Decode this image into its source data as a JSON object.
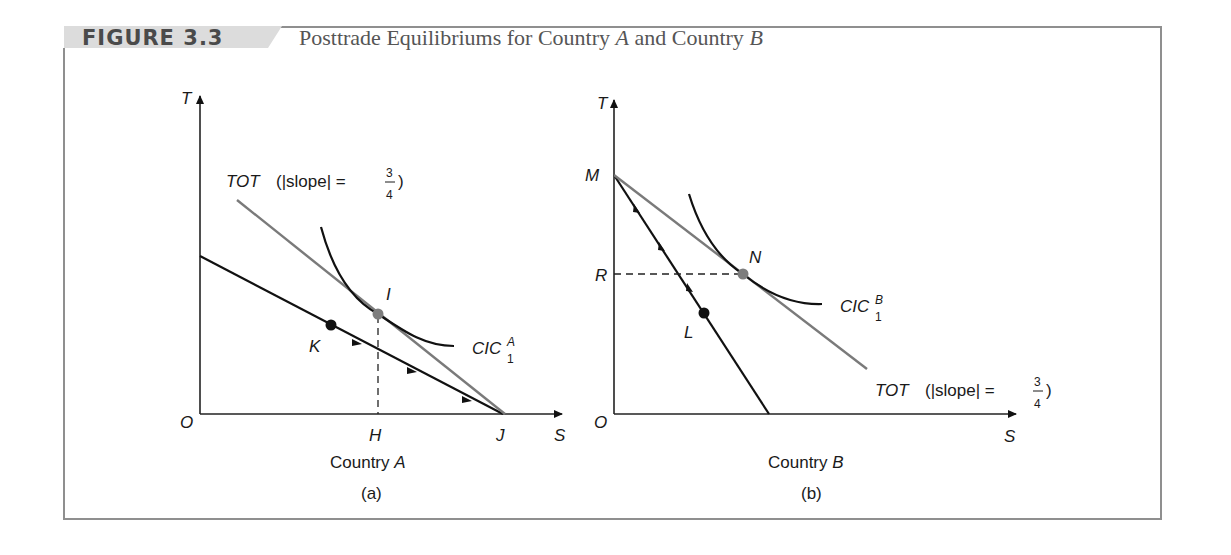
{
  "figure": {
    "number": "FIGURE 3.3",
    "title_prefix": "Posttrade Equilibriums for Country ",
    "title_country_a": "A",
    "title_mid": " and Country ",
    "title_country_b": "B"
  },
  "panel_a": {
    "y_axis_label": "T",
    "x_axis_label": "S",
    "origin_label": "O",
    "country_label_prefix": "Country ",
    "country_label_letter": "A",
    "caption": "(a)",
    "tot_label": "TOT",
    "tot_slope_text": "(|slope| = ",
    "tot_slope_num": "3",
    "tot_slope_den": "4",
    "tot_close": ")",
    "cic_label": "CIC",
    "cic_sup": "A",
    "cic_sub": "1",
    "points": {
      "I": "I",
      "K": "K",
      "H": "H",
      "J": "J"
    }
  },
  "panel_b": {
    "y_axis_label": "T",
    "x_axis_label": "S",
    "origin_label": "O",
    "country_label_prefix": "Country ",
    "country_label_letter": "B",
    "caption": "(b)",
    "tot_label": "TOT",
    "tot_slope_text": "(|slope| = ",
    "tot_slope_num": "3",
    "tot_slope_den": "4",
    "tot_close": ")",
    "cic_label": "CIC",
    "cic_sup": "B",
    "cic_sub": "1",
    "points": {
      "M": "M",
      "N": "N",
      "R": "R",
      "L": "L"
    }
  },
  "colors": {
    "tot_line": "#7a7a7a",
    "point_equilibrium": "#7d7d7d",
    "point_production": "#111111",
    "header_band": "#dcdcdc",
    "frame": "#8f8f8f"
  }
}
